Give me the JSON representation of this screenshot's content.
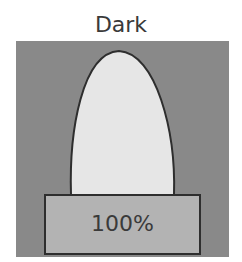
{
  "title": "Dark",
  "base_label": "100%",
  "colors": {
    "background": "#898989",
    "bulb_fill": "#e6e6e6",
    "base_fill": "#b3b3b3",
    "outline": "#2e2e2e",
    "text": "#3a3a3a"
  }
}
